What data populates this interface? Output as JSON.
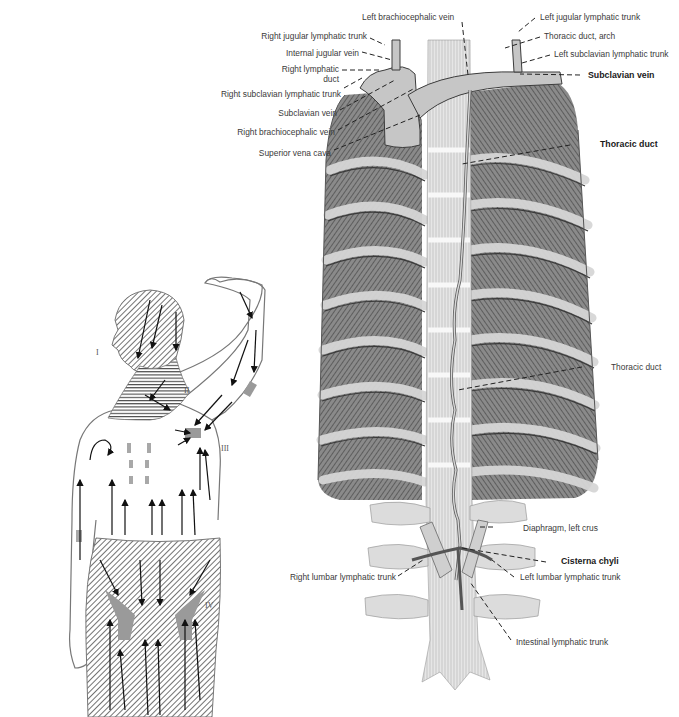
{
  "figure": {
    "thorax_labels_left": [
      {
        "id": "right-jugular-lymphatic-trunk",
        "text": "Right jugular lymphatic trunk",
        "bold": false
      },
      {
        "id": "internal-jugular-vein",
        "text": "Internal jugular vein",
        "bold": false
      },
      {
        "id": "right-lymphatic-duct",
        "text": "Right lymphatic",
        "text2": "duct",
        "bold": false
      },
      {
        "id": "right-subclavian-lymphatic-trunk",
        "text": "Right subclavian lymphatic trunk",
        "bold": false
      },
      {
        "id": "subclavian-vein-left-side",
        "text": "Subclavian vein",
        "bold": false
      },
      {
        "id": "right-brachiocephalic-vein",
        "text": "Right brachiocephalic vein",
        "bold": false
      },
      {
        "id": "superior-vena-cava",
        "text": "Superior vena cava",
        "bold": false
      }
    ],
    "thorax_labels_top": [
      {
        "id": "left-brachiocephalic-vein",
        "text": "Left brachiocephalic vein",
        "bold": false
      }
    ],
    "thorax_labels_right": [
      {
        "id": "left-jugular-lymphatic-trunk",
        "text": "Left jugular lymphatic trunk",
        "bold": false
      },
      {
        "id": "thoracic-duct-arch",
        "text": "Thoracic duct, arch",
        "bold": false
      },
      {
        "id": "left-subclavian-lymphatic-trunk",
        "text": "Left subclavian lymphatic trunk",
        "bold": false
      },
      {
        "id": "subclavian-vein",
        "text": "Subclavian vein",
        "bold": true
      },
      {
        "id": "thoracic-duct-upper",
        "text": "Thoracic duct",
        "bold": true
      },
      {
        "id": "thoracic-duct-lower",
        "text": "Thoracic duct",
        "bold": false
      },
      {
        "id": "diaphragm-left-crus",
        "text": "Diaphragm, left crus",
        "bold": false
      },
      {
        "id": "cisterna-chyli",
        "text": "Cisterna chyli",
        "bold": true
      },
      {
        "id": "left-lumbar-lymphatic-trunk",
        "text": "Left lumbar lymphatic trunk",
        "bold": false
      },
      {
        "id": "intestinal-lymphatic-trunk",
        "text": "Intestinal lymphatic trunk",
        "bold": false
      }
    ],
    "thorax_labels_bottom_left": [
      {
        "id": "right-lumbar-lymphatic-trunk",
        "text": "Right lumbar lymphatic trunk",
        "bold": false
      }
    ],
    "body_regions": [
      "I",
      "II",
      "III",
      "IV"
    ],
    "colors": {
      "label_text": "#3a3a3a",
      "leader_line": "#222222",
      "muscle_dark": "#6e6e6e",
      "rib_light": "#c9c9c9",
      "vein": "#bdbdbd",
      "hatch": "#555555",
      "node_fill": "#9a9a9a"
    }
  }
}
